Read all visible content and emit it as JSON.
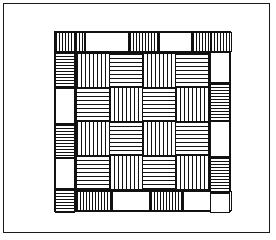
{
  "artwork": {
    "title": "Basketweave Quilt Pattern",
    "kind": "line-drawing",
    "medium": "black-and-white-diagram",
    "background_color": "#ffffff",
    "line_color": "#111111"
  },
  "page_frame": {
    "name": "outer-border-rectangle",
    "x": 3,
    "y": 3,
    "width": 267,
    "height": 230,
    "stroke": "#1a1a1a",
    "stroke_width": 1
  },
  "quilt_block": {
    "name": "quilt-block",
    "x": 50,
    "y": 27,
    "width": 177,
    "height": 181,
    "stroke": "#111111",
    "border_band_width": 20,
    "description": "Square quilt block with pieced striped border band surrounding a 4x4 basketweave checkerboard field."
  },
  "inner_field": {
    "name": "basketweave-field",
    "x": 20,
    "y": 20,
    "width": 135,
    "height": 139,
    "rows": 4,
    "columns": 4,
    "cell_width": 33,
    "cell_height": 34,
    "pattern": "checkerboard of alternating stripe orientation",
    "cells": [
      {
        "row": 0,
        "col": 0,
        "orientation": "vertical"
      },
      {
        "row": 0,
        "col": 1,
        "orientation": "horizontal"
      },
      {
        "row": 0,
        "col": 2,
        "orientation": "vertical"
      },
      {
        "row": 0,
        "col": 3,
        "orientation": "horizontal"
      },
      {
        "row": 1,
        "col": 0,
        "orientation": "horizontal"
      },
      {
        "row": 1,
        "col": 1,
        "orientation": "vertical"
      },
      {
        "row": 1,
        "col": 2,
        "orientation": "horizontal"
      },
      {
        "row": 1,
        "col": 3,
        "orientation": "vertical"
      },
      {
        "row": 2,
        "col": 0,
        "orientation": "vertical"
      },
      {
        "row": 2,
        "col": 1,
        "orientation": "horizontal"
      },
      {
        "row": 2,
        "col": 2,
        "orientation": "vertical"
      },
      {
        "row": 2,
        "col": 3,
        "orientation": "horizontal"
      },
      {
        "row": 3,
        "col": 0,
        "orientation": "horizontal"
      },
      {
        "row": 3,
        "col": 1,
        "orientation": "vertical"
      },
      {
        "row": 3,
        "col": 2,
        "orientation": "horizontal"
      },
      {
        "row": 3,
        "col": 3,
        "orientation": "vertical"
      }
    ]
  },
  "border_band": {
    "name": "pieced-border-band",
    "band_thickness": 20,
    "top_segments": [
      {
        "index": 0,
        "x": 0,
        "width": 20,
        "orientation": "vertical"
      },
      {
        "index": 1,
        "x": 20,
        "width": 10,
        "orientation": "vertical"
      },
      {
        "index": 2,
        "x": 30,
        "width": 44,
        "orientation": "plain"
      },
      {
        "index": 3,
        "x": 74,
        "width": 30,
        "orientation": "vertical"
      },
      {
        "index": 4,
        "x": 104,
        "width": 33,
        "orientation": "plain"
      },
      {
        "index": 5,
        "x": 137,
        "width": 30,
        "orientation": "vertical"
      },
      {
        "index": 6,
        "x": 167,
        "width": 10,
        "orientation": "plain"
      }
    ],
    "bottom_segments": [
      {
        "index": 0,
        "x": 0,
        "width": 12,
        "orientation": "horizontal"
      },
      {
        "index": 1,
        "x": 12,
        "width": 9,
        "orientation": "plain"
      },
      {
        "index": 2,
        "x": 21,
        "width": 36,
        "orientation": "vertical"
      },
      {
        "index": 3,
        "x": 57,
        "width": 38,
        "orientation": "plain"
      },
      {
        "index": 4,
        "x": 95,
        "width": 33,
        "orientation": "vertical"
      },
      {
        "index": 5,
        "x": 128,
        "width": 30,
        "orientation": "plain"
      },
      {
        "index": 6,
        "x": 158,
        "width": 19,
        "orientation": "vertical"
      }
    ],
    "left_segments": [
      {
        "index": 0,
        "y": 0,
        "height": 20,
        "orientation": "vertical"
      },
      {
        "index": 1,
        "y": 20,
        "height": 36,
        "orientation": "horizontal"
      },
      {
        "index": 2,
        "y": 56,
        "height": 36,
        "orientation": "plain"
      },
      {
        "index": 3,
        "y": 92,
        "height": 34,
        "orientation": "horizontal"
      },
      {
        "index": 4,
        "y": 126,
        "height": 31,
        "orientation": "plain"
      },
      {
        "index": 5,
        "y": 157,
        "height": 24,
        "orientation": "horizontal"
      }
    ],
    "right_segments": [
      {
        "index": 0,
        "y": 0,
        "height": 20,
        "orientation": "vertical"
      },
      {
        "index": 1,
        "y": 20,
        "height": 31,
        "orientation": "plain"
      },
      {
        "index": 2,
        "y": 51,
        "height": 38,
        "orientation": "horizontal"
      },
      {
        "index": 3,
        "y": 89,
        "height": 36,
        "orientation": "plain"
      },
      {
        "index": 4,
        "y": 125,
        "height": 36,
        "orientation": "horizontal"
      },
      {
        "index": 5,
        "y": 161,
        "height": 20,
        "orientation": "plain"
      }
    ]
  }
}
